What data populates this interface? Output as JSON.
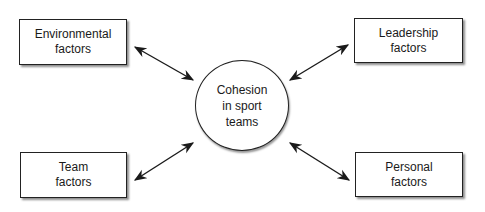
{
  "diagram": {
    "center": {
      "label": "Cohesion\nin sport\nteams"
    },
    "nodes": [
      {
        "id": "environmental",
        "label": "Environmental\nfactors"
      },
      {
        "id": "leadership",
        "label": "Leadership\nfactors"
      },
      {
        "id": "team",
        "label": "Team\nfactors"
      },
      {
        "id": "personal",
        "label": "Personal\nfactors"
      }
    ],
    "edges": [
      {
        "from": "environmental",
        "to": "center",
        "type": "bidirectional"
      },
      {
        "from": "leadership",
        "to": "center",
        "type": "bidirectional"
      },
      {
        "from": "team",
        "to": "center",
        "type": "bidirectional"
      },
      {
        "from": "personal",
        "to": "center",
        "type": "bidirectional"
      }
    ],
    "colors": {
      "stroke": "#222222",
      "background": "#ffffff"
    }
  }
}
